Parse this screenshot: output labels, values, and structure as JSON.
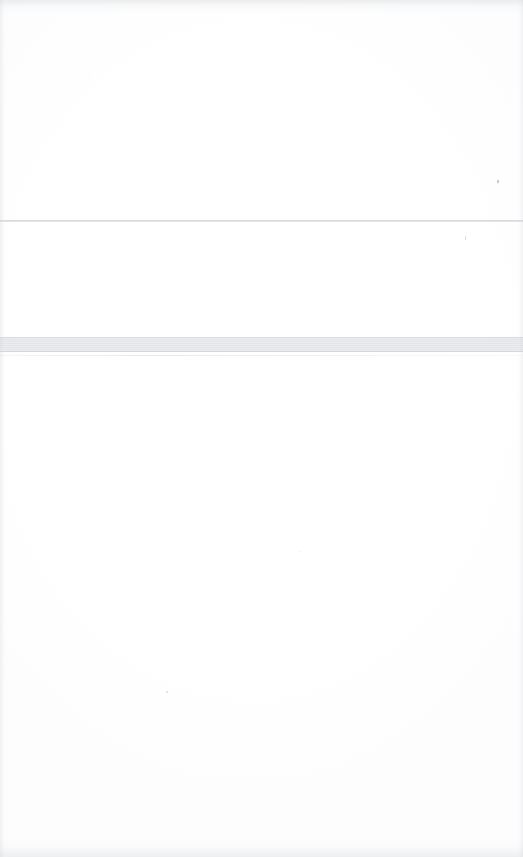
{
  "document": {
    "kind": "scanned-page",
    "description": "Blank scanned document page",
    "page_width": 523,
    "page_height": 857,
    "page_color": "#ffffff",
    "has_visible_text": false,
    "text_content": ""
  },
  "regions": [
    {
      "name": "upper-blank-area",
      "label": "",
      "top": 0,
      "height": 220,
      "content": ""
    },
    {
      "name": "middle-blank-area",
      "label": "",
      "top": 222,
      "height": 115,
      "content": ""
    },
    {
      "name": "lower-blank-area",
      "label": "",
      "top": 356,
      "height": 501,
      "content": ""
    }
  ],
  "rules": [
    {
      "name": "upper-hairline",
      "y": 220,
      "thickness": 2,
      "color": "#9ea3aa",
      "full_width": true
    },
    {
      "name": "gray-band",
      "y": 337,
      "thickness": 15,
      "color": "#eceef1",
      "border_color": "#c6cad0",
      "full_width": true
    },
    {
      "name": "lower-hairline",
      "y": 355,
      "thickness": 1,
      "color": "#c6cad0",
      "full_width": true
    }
  ],
  "edge_shading": {
    "top_color": "#cdd0d4",
    "bottom_color": "#d0d3d7",
    "left_color": "#ced1d5",
    "right_color": "#ced1d5"
  },
  "specks": [
    {
      "name": "speck-right-upper",
      "x": 497,
      "y": 180,
      "size": 2
    },
    {
      "name": "speck-right-middle",
      "x": 465,
      "y": 236,
      "size": 1
    },
    {
      "name": "speck-center-lower",
      "x": 166,
      "y": 691,
      "size": 1
    },
    {
      "name": "speck-center-body",
      "x": 300,
      "y": 551,
      "size": 1
    }
  ]
}
